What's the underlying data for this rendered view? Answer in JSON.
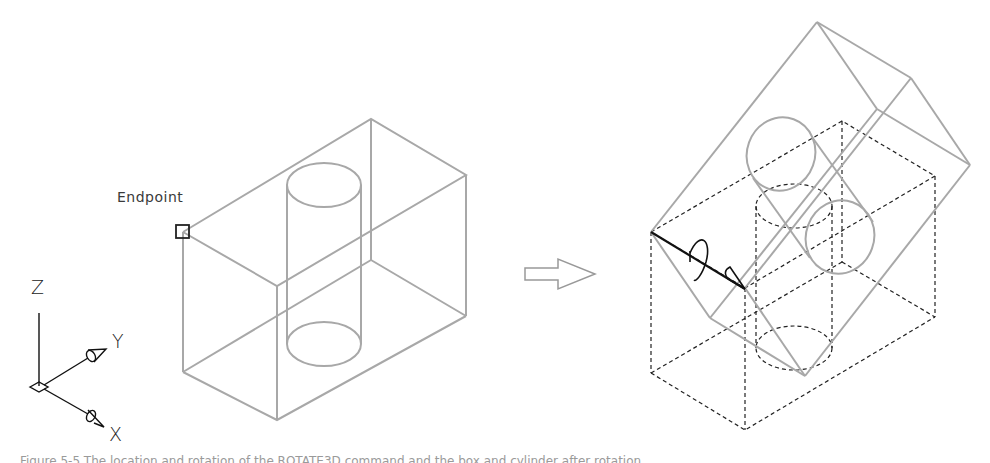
{
  "figure": {
    "left_drawing": {
      "endpoint_label": "Endpoint",
      "ucs_icon": {
        "z": "Z",
        "y": "Y",
        "x": "X"
      }
    },
    "arrow": {
      "icon": "right-arrow-outline-icon"
    },
    "right_drawing": {
      "description": "box with cylinder rotated about axis through endpoint; original position dashed"
    },
    "caption": "Figure 5-5  The location and rotation of the ROTATE3D command and the box and cylinder after rotation"
  },
  "colors": {
    "solid_gray": "#a8a8a8",
    "dashed_black": "#222222",
    "axis_black": "#111111"
  }
}
